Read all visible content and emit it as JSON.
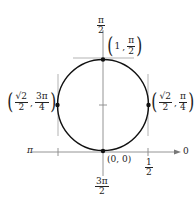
{
  "diagram": {
    "type": "polar-graph",
    "curve": "circle",
    "axis_labels": {
      "top": {
        "num": "π",
        "den": "2"
      },
      "bottom": {
        "num": "3π",
        "den": "2"
      },
      "left": "π",
      "right": "0"
    },
    "tick_labels": {
      "half": {
        "num": "1",
        "den": "2"
      }
    },
    "points": [
      {
        "label_r": "1",
        "label_theta": {
          "num": "π",
          "den": "2"
        },
        "position": "top"
      },
      {
        "label_r": {
          "num": "√2",
          "den": "2"
        },
        "label_theta": {
          "num": "3π",
          "den": "4"
        },
        "position": "left"
      },
      {
        "label_r": {
          "num": "√2",
          "den": "2"
        },
        "label_theta": {
          "num": "π",
          "den": "4"
        },
        "position": "right"
      },
      {
        "label": "(0, 0)",
        "position": "bottom"
      }
    ],
    "colors": {
      "curve": "#111111",
      "axis": "#888888",
      "tangent": "#aaaaaa"
    }
  }
}
